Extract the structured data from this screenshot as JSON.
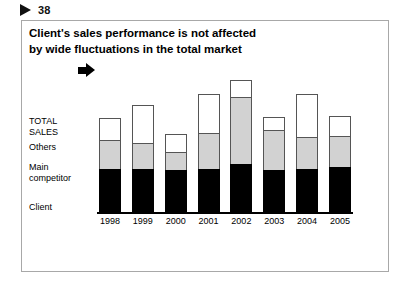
{
  "page_marker": {
    "icon": "triangle-right-icon",
    "number": "38"
  },
  "slide": {
    "title_line1": "Client's sales performance is not affected",
    "title_line2": "by wide fluctuations in the total market"
  },
  "legend": {
    "total_sales_line1": "TOTAL",
    "total_sales_line2": "SALES",
    "others": "Others",
    "main_competitor_line1": "Main",
    "main_competitor_line2": "competitor",
    "client": "Client",
    "arrow_icon": "arrow-right-icon"
  },
  "colors": {
    "client": "#000000",
    "main_competitor": "#d2d2d2",
    "others": "#ffffff",
    "outline": "#555555",
    "frame": "#a8a8a8"
  },
  "chart_data": {
    "type": "bar",
    "title": "Client's sales performance is not affected by wide fluctuations in the total market",
    "xlabel": "",
    "ylabel": "",
    "stacked": true,
    "grid": false,
    "legend_position": "left",
    "axis_labels_visible": false,
    "ylim": [
      0,
      100
    ],
    "categories": [
      "1998",
      "1999",
      "2000",
      "2001",
      "2002",
      "2003",
      "2004",
      "2005"
    ],
    "series": [
      {
        "name": "Client",
        "color": "#000000",
        "values": [
          30,
          30,
          29,
          30,
          33,
          29,
          30,
          31
        ]
      },
      {
        "name": "Main competitor",
        "color": "#d2d2d2",
        "values": [
          20,
          18,
          13,
          25,
          47,
          28,
          22,
          22
        ]
      },
      {
        "name": "Others",
        "color": "#ffffff",
        "values": [
          15,
          26,
          12,
          27,
          12,
          9,
          30,
          14
        ]
      }
    ],
    "totals": [
      65,
      74,
      54,
      82,
      92,
      66,
      82,
      67
    ],
    "annotations": [
      {
        "text": "TOTAL SALES",
        "target_category": "1998",
        "type": "arrow-callout"
      }
    ]
  }
}
